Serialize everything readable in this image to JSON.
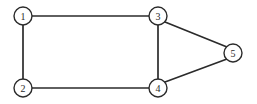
{
  "figure": {
    "kind": "undirected-graph-diagram",
    "background_color": "#ffffff",
    "line_color": "#2b2b2b",
    "node_fill_color": "#ffffff",
    "label_color": "#2b2b2b",
    "width": 257,
    "height": 104
  },
  "nodes": [
    {
      "id": "1",
      "label": "1",
      "cx": 23,
      "cy": 16,
      "r": 9
    },
    {
      "id": "2",
      "label": "2",
      "cx": 23,
      "cy": 88,
      "r": 9
    },
    {
      "id": "3",
      "label": "3",
      "cx": 158,
      "cy": 16,
      "r": 9
    },
    {
      "id": "4",
      "label": "4",
      "cx": 158,
      "cy": 88,
      "r": 9
    },
    {
      "id": "5",
      "label": "5",
      "cx": 233,
      "cy": 53,
      "r": 9
    }
  ],
  "edges": [
    {
      "id": "edge-1-3",
      "from": "1",
      "to": "3",
      "x1": 32,
      "y1": 16,
      "x2": 149,
      "y2": 16
    },
    {
      "id": "edge-1-2",
      "from": "1",
      "to": "2",
      "x1": 23,
      "y1": 25,
      "x2": 23,
      "y2": 79
    },
    {
      "id": "edge-2-4",
      "from": "2",
      "to": "4",
      "x1": 32,
      "y1": 88,
      "x2": 149,
      "y2": 88
    },
    {
      "id": "edge-3-4",
      "from": "3",
      "to": "4",
      "x1": 158,
      "y1": 25,
      "x2": 158,
      "y2": 79
    },
    {
      "id": "edge-3-5",
      "from": "3",
      "to": "5",
      "x1": 165,
      "y1": 22,
      "x2": 227,
      "y2": 47
    },
    {
      "id": "edge-4-5",
      "from": "4",
      "to": "5",
      "x1": 165,
      "y1": 82,
      "x2": 227,
      "y2": 59
    }
  ]
}
